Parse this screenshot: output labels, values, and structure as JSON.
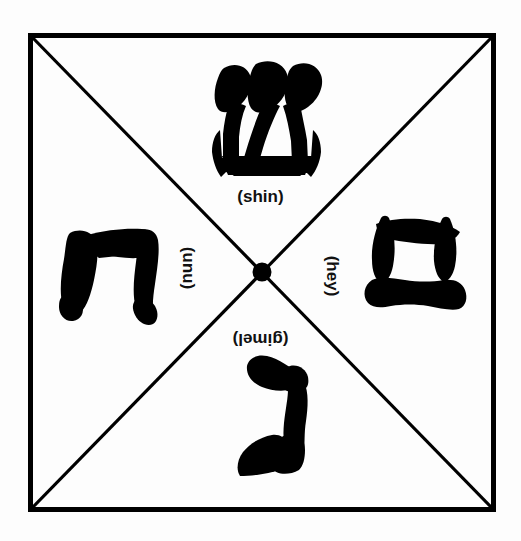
{
  "diagram": {
    "shape": "square-with-diagonals",
    "background_color": "#fdfdfd",
    "ink_color": "#000000",
    "border": {
      "color": "#000000",
      "width_px": 5,
      "left": 28,
      "top": 33,
      "right": 494,
      "bottom": 512
    },
    "diagonals": {
      "color": "#000000",
      "width_px": 3,
      "count": 2,
      "description": "two diagonals crossing corner to corner"
    },
    "center_dot": {
      "color": "#000000",
      "cx": 261,
      "cy": 272,
      "r": 9
    }
  },
  "quadrants": [
    {
      "position": "top",
      "label": "(shin)",
      "letter_name": "shin",
      "hebrew_letter": "ש",
      "rotation_deg": 0,
      "glyph_color": "#000000"
    },
    {
      "position": "right",
      "label": "(hey)",
      "letter_name": "hey",
      "hebrew_letter": "ה",
      "rotation_deg": 90,
      "glyph_color": "#000000"
    },
    {
      "position": "bottom",
      "label": "(gimel)",
      "letter_name": "gimel",
      "hebrew_letter": "ג",
      "rotation_deg": 180,
      "glyph_color": "#000000"
    },
    {
      "position": "left",
      "label": "(nun)",
      "letter_name": "nun",
      "hebrew_letter": "נ",
      "rotation_deg": 270,
      "glyph_color": "#000000"
    }
  ]
}
